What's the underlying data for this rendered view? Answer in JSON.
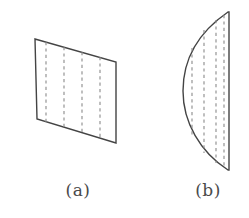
{
  "figure": {
    "background_color": "#ffffff",
    "outline_color": "#444444",
    "dash_color": "#8a8a8a",
    "caption_color": "#4a4a4a",
    "panels": [
      {
        "id": "panel-a",
        "caption": "(a)",
        "shape": "sheared-quadrilateral",
        "description": "flat parallelogram sheet with four vertical dashed rulings",
        "corners": [
          {
            "x": 35,
            "y": 39
          },
          {
            "x": 116,
            "y": 62
          },
          {
            "x": 116,
            "y": 143
          },
          {
            "x": 37,
            "y": 119
          }
        ],
        "dashed_lines": [
          {
            "x": 46,
            "y_top": 42,
            "y_bottom": 122
          },
          {
            "x": 64,
            "y_top": 47,
            "y_bottom": 128
          },
          {
            "x": 82,
            "y_top": 52,
            "y_bottom": 133
          },
          {
            "x": 100,
            "y_top": 57,
            "y_bottom": 138
          }
        ]
      },
      {
        "id": "panel-b",
        "caption": "(b)",
        "shape": "lens-arc-sheet",
        "description": "curved sheet, straight right edge with arc bulging to the left",
        "apex_top": {
          "x": 228,
          "y": 12
        },
        "apex_bottom": {
          "x": 228,
          "y": 170
        },
        "arc_leftmost": {
          "x": 183,
          "y": 91
        },
        "straight_edge_x": 229,
        "dashed_lines": [
          {
            "x": 192,
            "y_top": 48,
            "y_bottom": 136
          },
          {
            "x": 204,
            "y_top": 30,
            "y_bottom": 153
          },
          {
            "x": 216,
            "y_top": 20,
            "y_bottom": 163
          },
          {
            "x": 224,
            "y_top": 15,
            "y_bottom": 168
          }
        ]
      }
    ]
  }
}
